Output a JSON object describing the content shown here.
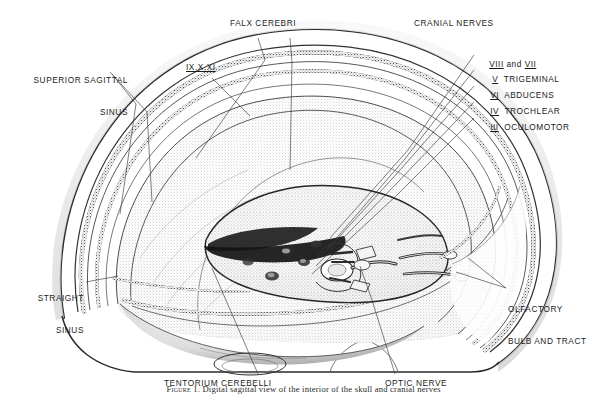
{
  "figure": {
    "type": "medical-anatomical-illustration",
    "view": "midsagittal-oblique",
    "ink_color": "#1d1d1d",
    "background_color": "#ffffff"
  },
  "labels": {
    "superior_sagittal_sinus": {
      "line1": "SUPERIOR SAGITTAL",
      "line2": "SINUS"
    },
    "falx_cerebri": "FALX CEREBRI",
    "ix_x_xi": "IX,X,XI",
    "cranial_nerves_heading": "CRANIAL NERVES",
    "straight_sinus": {
      "line1": "STRAIGHT",
      "line2": "SINUS"
    },
    "tentorium_cerebelli": "TENTORIUM CEREBELLI",
    "optic_nerve": "OPTIC NERVE",
    "olfactory_bulb_and_tract": {
      "line1": "OLFACTORY",
      "line2": "BULB AND TRACT"
    }
  },
  "cranial_nerves": [
    {
      "numeral": "VIII",
      "conjunction": " and ",
      "numeral2": "VII",
      "name": ""
    },
    {
      "numeral": "V",
      "name": "TRIGEMINAL"
    },
    {
      "numeral": "VI",
      "name": "ABDUCENS"
    },
    {
      "numeral": "IV",
      "name": "TROCHLEAR"
    },
    {
      "numeral": "III",
      "name": "OCULOMOTOR"
    }
  ],
  "caption": {
    "figure_number": "Figure 1.",
    "text": "Digital sagittal view of the interior of the skull and cranial nerves"
  }
}
